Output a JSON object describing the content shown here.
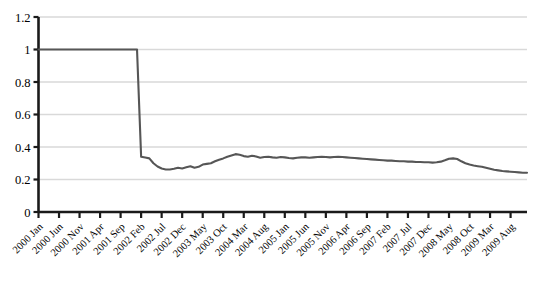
{
  "chart_data": {
    "type": "line",
    "title": "",
    "subtitle": "",
    "xlabel": "",
    "ylabel": "",
    "grid": true,
    "legend": null,
    "legend_position": "none",
    "ylim": [
      0,
      1.2
    ],
    "ytick_labels": [
      "1.2",
      "1",
      "0.8",
      "0.6",
      "0.4",
      "0.2",
      "0"
    ],
    "ytick_values": [
      1.2,
      1,
      0.8,
      0.6,
      0.4,
      0.2,
      0
    ],
    "xtick_labels": [
      "2000 Jan",
      "2000 Jun",
      "2000 Nov",
      "2001 Apr",
      "2001 Sep",
      "2002 Feb",
      "2002 Jul",
      "2002 Dec",
      "2003 May",
      "2003 Oct",
      "2004 Mar",
      "2004 Aug",
      "2005 Jan",
      "2005 Jun",
      "2005 Nov",
      "2006 Apr",
      "2006 Sep",
      "2007 Feb",
      "2007 Jul",
      "2007 Dec",
      "2008 May",
      "2008 Oct",
      "2009 Mar",
      "2009 Aug"
    ],
    "xtick_interval_months": 5,
    "x_start": "2000 Jan",
    "x_end": "2009 Dec",
    "series": [
      {
        "name": "index",
        "color": "#565656",
        "values": [
          1.0,
          1.0,
          1.0,
          1.0,
          1.0,
          1.0,
          1.0,
          1.0,
          1.0,
          1.0,
          1.0,
          1.0,
          1.0,
          1.0,
          1.0,
          1.0,
          1.0,
          1.0,
          1.0,
          1.0,
          1.0,
          1.0,
          1.0,
          1.0,
          1.0,
          0.34,
          0.335,
          0.33,
          0.3,
          0.28,
          0.268,
          0.262,
          0.262,
          0.266,
          0.272,
          0.268,
          0.275,
          0.282,
          0.272,
          0.278,
          0.292,
          0.296,
          0.3,
          0.312,
          0.322,
          0.33,
          0.34,
          0.348,
          0.356,
          0.352,
          0.344,
          0.34,
          0.346,
          0.342,
          0.334,
          0.338,
          0.34,
          0.336,
          0.334,
          0.338,
          0.336,
          0.332,
          0.33,
          0.334,
          0.336,
          0.336,
          0.334,
          0.336,
          0.338,
          0.34,
          0.338,
          0.336,
          0.338,
          0.34,
          0.338,
          0.336,
          0.334,
          0.332,
          0.33,
          0.328,
          0.326,
          0.324,
          0.322,
          0.32,
          0.318,
          0.316,
          0.316,
          0.314,
          0.312,
          0.312,
          0.31,
          0.31,
          0.308,
          0.308,
          0.306,
          0.306,
          0.304,
          0.306,
          0.31,
          0.318,
          0.328,
          0.33,
          0.326,
          0.312,
          0.3,
          0.292,
          0.286,
          0.282,
          0.278,
          0.272,
          0.266,
          0.26,
          0.256,
          0.252,
          0.25,
          0.248,
          0.246,
          0.244,
          0.242,
          0.242
        ]
      }
    ],
    "annotations": [],
    "axis_color": "#1a1a1a",
    "gridline_color": "#d9d9d9",
    "background": "#ffffff"
  }
}
